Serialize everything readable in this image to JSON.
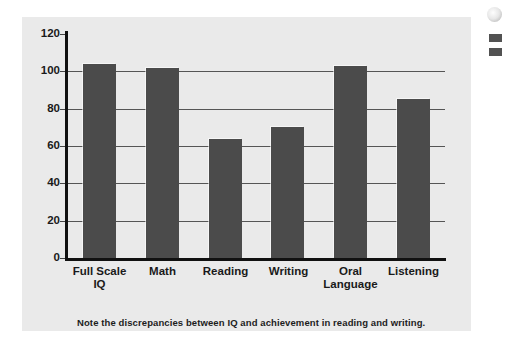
{
  "figure": {
    "caption": "Note the discrepancies between IQ and achievement in reading and writing.",
    "panel_background": "#eaeaea",
    "bar_color": "#4b4b4b",
    "axis_color": "#111111",
    "gridline_color": "#555555"
  },
  "chart_data": {
    "type": "bar",
    "title": "",
    "subtitle": "",
    "xlabel": "",
    "ylabel": "",
    "categories": [
      "Full Scale\nIQ",
      "Math",
      "Reading",
      "Writing",
      "Oral\nLanguage",
      "Listening"
    ],
    "category_lines": [
      [
        "Full Scale",
        "IQ"
      ],
      [
        "Math"
      ],
      [
        "Reading"
      ],
      [
        "Writing"
      ],
      [
        "Oral",
        "Language"
      ],
      [
        "Listening"
      ]
    ],
    "values": [
      104,
      102,
      64,
      70,
      103,
      85
    ],
    "ylim": [
      0,
      120
    ],
    "ytick_labels": [
      "120",
      "100",
      "80",
      "60",
      "40",
      "20",
      "0"
    ],
    "ytick_values": [
      120,
      100,
      80,
      60,
      40,
      20,
      0
    ],
    "ytick_interval": 20,
    "grid": true,
    "grid_axis": "y",
    "legend": false,
    "legend_position": "none",
    "annotations": [
      "Note the discrepancies between IQ and achievement in reading and writing."
    ]
  }
}
